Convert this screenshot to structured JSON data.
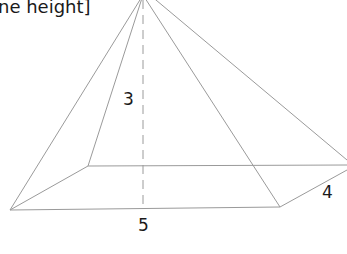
{
  "caption": "ne height]",
  "figure": {
    "type": "rectangular pyramid",
    "labels": {
      "height": "3",
      "base_length": "5",
      "base_width": "4"
    },
    "colors": {
      "edge": "#9a9a9a",
      "text": "#1a1a1a"
    }
  }
}
